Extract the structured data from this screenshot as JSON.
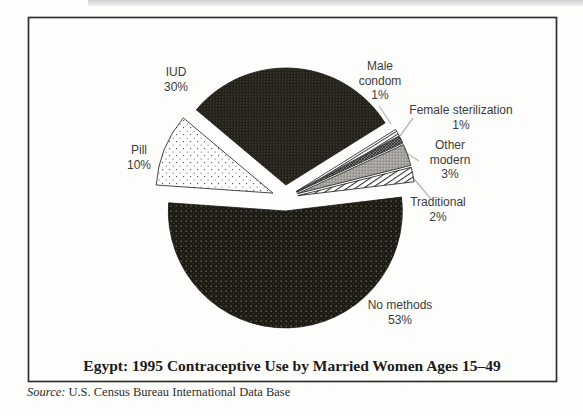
{
  "frame": {
    "source_label": "Source:",
    "source_text": "U.S. Census Bureau International Data Base"
  },
  "chart_data": {
    "type": "pie",
    "title": "Egypt: 1995 Contraceptive Use by Married Women Ages 15–49",
    "unit": "percent of married women ages 15-49",
    "start_angle_deg": 140,
    "direction": "clockwise",
    "exploded": true,
    "legend_position": "labels-around-pie",
    "slices": [
      {
        "id": "iud",
        "label": "IUD",
        "value": 30,
        "pct": "30%",
        "pattern": "pat-dark-dots-fine",
        "pattern_desc": "black with fine light dot grid"
      },
      {
        "id": "male-condom",
        "label": "Male condom",
        "value": 1,
        "pct": "1%",
        "pattern": "pat-fine-diag",
        "pattern_desc": "white with thin diagonal stripes"
      },
      {
        "id": "female-sterilization",
        "label": "Female sterilization",
        "value": 1,
        "pct": "1%",
        "pattern": "pat-dark-cross",
        "pattern_desc": "dark gray crosshatch"
      },
      {
        "id": "other-modern",
        "label": "Other modern",
        "value": 3,
        "pct": "3%",
        "pattern": "pat-gray-dots",
        "pattern_desc": "gray halftone dots"
      },
      {
        "id": "traditional",
        "label": "Traditional",
        "value": 2,
        "pct": "2%",
        "pattern": "pat-diag",
        "pattern_desc": "white with diagonal hatch"
      },
      {
        "id": "no-methods",
        "label": "No methods",
        "value": 53,
        "pct": "53%",
        "pattern": "pat-dark-dots",
        "pattern_desc": "black with sparse white dots"
      },
      {
        "id": "pill",
        "label": "Pill",
        "value": 10,
        "pct": "10%",
        "pattern": "pat-white-dots",
        "pattern_desc": "white with sparse black dots"
      }
    ]
  },
  "colors": {
    "ink_dark": "#1e1b15",
    "label_text": "#3c3c3c",
    "leader_line": "#b8b8b8",
    "frame_border": "#2f2f2f",
    "slice_outline": "#1a1a1a",
    "gray_mid": "#a3a3a3",
    "background": "#fdfdfc"
  }
}
